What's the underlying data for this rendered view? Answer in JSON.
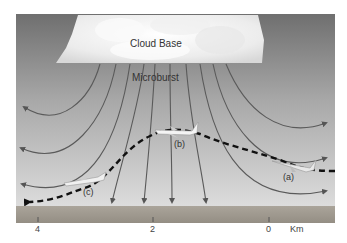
{
  "diagram": {
    "title_labels": {
      "cloud_base": "Cloud Base",
      "microburst": "Microburst"
    },
    "aircraft_positions": [
      {
        "id": "a",
        "label": "(a)"
      },
      {
        "id": "b",
        "label": "(b)"
      },
      {
        "id": "c",
        "label": "(c)"
      }
    ],
    "axis": {
      "ticks": [
        "4",
        "2",
        "0"
      ],
      "unit": "Km"
    },
    "colors": {
      "sky_top": "#7a7a7a",
      "sky_bottom": "#d4d4d4",
      "ground": "#a09a90",
      "arrows": "#555555",
      "flight_path": "#111111",
      "cloud": "#f4f4f4"
    }
  }
}
